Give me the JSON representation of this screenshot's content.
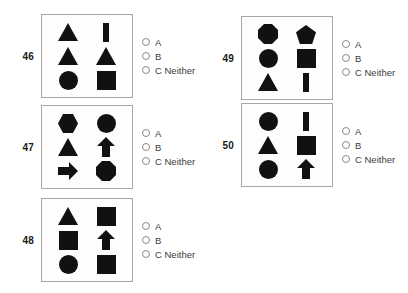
{
  "page": {
    "shape_color": "#111111",
    "box_border_color": "#a8a8a8"
  },
  "options_template": [
    {
      "letter": "A",
      "label": "A"
    },
    {
      "letter": "B",
      "label": "B"
    },
    {
      "letter": "C",
      "label": "C Neither"
    }
  ],
  "questions": [
    {
      "number": "46",
      "x": 14,
      "y": 14,
      "shapes": [
        [
          "triangle",
          "vertical-bar"
        ],
        [
          "triangle",
          "triangle"
        ],
        [
          "circle",
          "square"
        ]
      ],
      "options": [
        {
          "label": "A",
          "selected": false
        },
        {
          "label": "B",
          "selected": false
        },
        {
          "label": "C Neither",
          "selected": false
        }
      ]
    },
    {
      "number": "47",
      "x": 14,
      "y": 105,
      "shapes": [
        [
          "hexagon",
          "circle"
        ],
        [
          "triangle",
          "arrow-up"
        ],
        [
          "arrow-right",
          "octagon"
        ]
      ],
      "options": [
        {
          "label": "A",
          "selected": false
        },
        {
          "label": "B",
          "selected": false
        },
        {
          "label": "C Neither",
          "selected": false
        }
      ]
    },
    {
      "number": "48",
      "x": 14,
      "y": 198,
      "shapes": [
        [
          "triangle",
          "square"
        ],
        [
          "square",
          "arrow-up"
        ],
        [
          "circle",
          "square"
        ]
      ],
      "options": [
        {
          "label": "A",
          "selected": false
        },
        {
          "label": "B",
          "selected": false
        },
        {
          "label": "C Neither",
          "selected": false
        }
      ]
    },
    {
      "number": "49",
      "x": 214,
      "y": 16,
      "shapes": [
        [
          "octagon",
          "pentagon"
        ],
        [
          "circle",
          "square"
        ],
        [
          "triangle",
          "vertical-bar"
        ]
      ],
      "options": [
        {
          "label": "A",
          "selected": false
        },
        {
          "label": "B",
          "selected": false
        },
        {
          "label": "C Neither",
          "selected": false
        }
      ]
    },
    {
      "number": "50",
      "x": 214,
      "y": 103,
      "shapes": [
        [
          "circle",
          "vertical-bar"
        ],
        [
          "triangle",
          "square"
        ],
        [
          "circle",
          "arrow-up"
        ]
      ],
      "options": [
        {
          "label": "A",
          "selected": false
        },
        {
          "label": "B",
          "selected": false
        },
        {
          "label": "C Neither",
          "selected": false
        }
      ]
    }
  ]
}
